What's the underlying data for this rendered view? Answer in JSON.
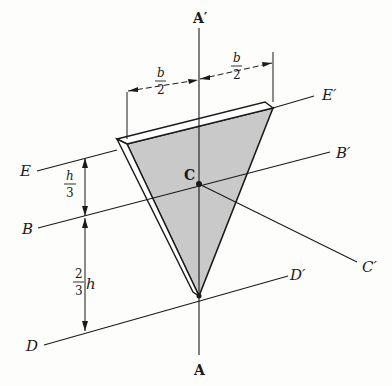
{
  "diagram": {
    "labels": {
      "A_prime": "A′",
      "A": "A",
      "E": "E",
      "E_prime": "E′",
      "B": "B",
      "B_prime": "B′",
      "C": "C",
      "C_prime": "C′",
      "D": "D",
      "D_prime": "D′"
    },
    "dimensions": {
      "half_base_left": {
        "num": "b",
        "den": "2"
      },
      "half_base_right": {
        "num": "b",
        "den": "2"
      },
      "third_height": {
        "num": "h",
        "den": "3"
      },
      "two_thirds_height": {
        "num": "2",
        "den": "3",
        "var": "h"
      }
    },
    "colors": {
      "fill": "#c9c9c9",
      "stroke": "#1a1a1a",
      "background": "#fdfdfb"
    }
  }
}
